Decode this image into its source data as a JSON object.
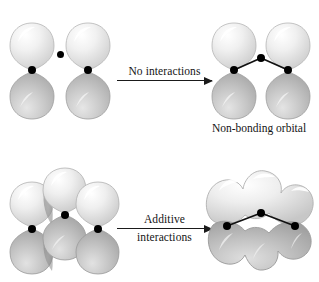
{
  "figure": {
    "background_color": "#ffffff",
    "width": 319,
    "height": 282,
    "orbital_fill_light": "#f2f2f2",
    "orbital_fill_mid": "#c9c9c9",
    "orbital_fill_dark": "#a8a8a8",
    "outline_color": "#9a9a9a",
    "nucleus_color": "#000000",
    "bond_color": "#111111"
  },
  "rows": [
    {
      "id": "top-row",
      "left_structure": {
        "name": "two-isolated-p-orbitals",
        "orbital_count": 2,
        "lone_electron_dot": true
      },
      "arrow": {
        "label_above": "No interactions",
        "label_below": "",
        "x": 117,
        "y": 80,
        "length": 95,
        "direction": "right"
      },
      "right_structure": {
        "name": "non-bonding-orbital-set",
        "orbital_count": 2,
        "bond_vertices": 3
      },
      "caption": "Non-bonding orbital"
    },
    {
      "id": "bottom-row",
      "left_structure": {
        "name": "three-overlapping-p-orbitals",
        "orbital_count": 3,
        "lone_electron_dot": false
      },
      "arrow": {
        "label_above": "Additive",
        "label_below": "interactions",
        "x": 117,
        "y": 228,
        "length": 95,
        "direction": "right"
      },
      "right_structure": {
        "name": "fused-bonding-molecular-orbital",
        "orbital_count": 3,
        "bond_vertices": 3
      },
      "caption": ""
    }
  ]
}
